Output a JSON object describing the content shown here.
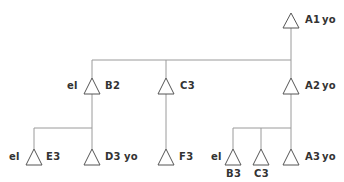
{
  "diagram": {
    "type": "tree",
    "nodes": [
      {
        "id": "A1",
        "label": "A1",
        "suffix": "yo",
        "prefix": "",
        "x": 291,
        "y": 13
      },
      {
        "id": "B2",
        "label": "B2",
        "suffix": "",
        "prefix": "el",
        "x": 92,
        "y": 78
      },
      {
        "id": "C3_top",
        "label": "C3",
        "suffix": "",
        "prefix": "",
        "x": 166,
        "y": 78
      },
      {
        "id": "A2",
        "label": "A2",
        "suffix": "yo",
        "prefix": "",
        "x": 291,
        "y": 78
      },
      {
        "id": "E3",
        "label": "E3",
        "suffix": "",
        "prefix": "el",
        "x": 34,
        "y": 149
      },
      {
        "id": "D3",
        "label": "D3",
        "suffix": "yo",
        "prefix": "",
        "x": 92,
        "y": 149
      },
      {
        "id": "F3",
        "label": "F3",
        "suffix": "",
        "prefix": "",
        "x": 166,
        "y": 149
      },
      {
        "id": "B3",
        "label": "B3",
        "suffix": "",
        "prefix": "el",
        "x": 233,
        "y": 149,
        "label_below": true
      },
      {
        "id": "C3_bottom",
        "label": "C3",
        "suffix": "",
        "prefix": "",
        "x": 261,
        "y": 149,
        "label_below": true
      },
      {
        "id": "A3",
        "label": "A3",
        "suffix": "yo",
        "prefix": "",
        "x": 291,
        "y": 149
      }
    ],
    "edges": [
      [
        "A1",
        "B2"
      ],
      [
        "A1",
        "C3_top"
      ],
      [
        "A1",
        "A2"
      ],
      [
        "B2",
        "E3"
      ],
      [
        "B2",
        "D3"
      ],
      [
        "C3_top",
        "F3"
      ],
      [
        "A2",
        "B3"
      ],
      [
        "A2",
        "C3_bottom"
      ],
      [
        "A2",
        "A3"
      ]
    ]
  },
  "labels": {
    "a1": "A1",
    "a1_yo": "yo",
    "b2_el": "el",
    "b2": "B2",
    "c3_top": "C3",
    "a2": "A2",
    "a2_yo": "yo",
    "e3_el": "el",
    "e3": "E3",
    "d3": "D3",
    "d3_yo": "yo",
    "f3": "F3",
    "b3_el": "el",
    "b3": "B3",
    "c3_bottom": "C3",
    "a3": "A3",
    "a3_yo": "yo"
  }
}
